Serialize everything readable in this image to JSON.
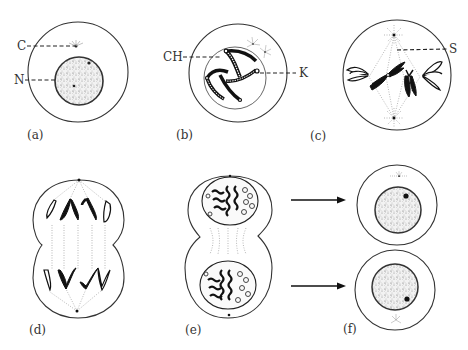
{
  "figure": {
    "panels": [
      {
        "id": "a",
        "label": "(a)",
        "annotations": [
          {
            "key": "C",
            "text": "C"
          },
          {
            "key": "N",
            "text": "N"
          }
        ]
      },
      {
        "id": "b",
        "label": "(b)",
        "annotations": [
          {
            "key": "CH",
            "text": "CH"
          },
          {
            "key": "K",
            "text": "K"
          }
        ]
      },
      {
        "id": "c",
        "label": "(c)",
        "annotations": [
          {
            "key": "S",
            "text": "S"
          }
        ]
      },
      {
        "id": "d",
        "label": "(d)",
        "annotations": []
      },
      {
        "id": "e",
        "label": "(e)",
        "annotations": []
      },
      {
        "id": "f",
        "label": "(f)",
        "annotations": []
      }
    ],
    "arrows": [
      {
        "from": "e-top",
        "to": "f-top"
      },
      {
        "from": "e-bottom",
        "to": "f-bottom"
      }
    ],
    "colors": {
      "line": "#333333",
      "chromosome": "#111111",
      "spindle": "#999999",
      "background": "#ffffff"
    }
  }
}
